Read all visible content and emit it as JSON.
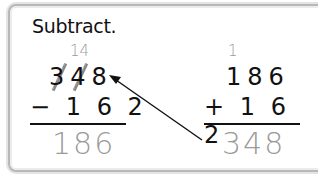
{
  "heading": "Subtract.",
  "subtraction": {
    "regroup_mark": "14",
    "minuend": "348",
    "operator_line": "− 1 6 2",
    "answer": "186"
  },
  "addition_check": {
    "carry_mark": "1",
    "addend1": "186",
    "operator_line": "+ 1 6 2",
    "answer": "348"
  },
  "arrow": {
    "from": "addition-answer",
    "to": "minuend",
    "color": "#111111"
  },
  "colors": {
    "text": "#111111",
    "answer": "#9a9a9a",
    "border": "#b8b8b8"
  }
}
